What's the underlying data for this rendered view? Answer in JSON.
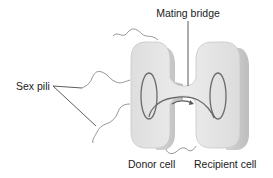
{
  "diagram": {
    "labels": {
      "mating_bridge": "Mating bridge",
      "sex_pili": "Sex pili",
      "donor_cell": "Donor cell",
      "recipient_cell": "Recipient cell"
    },
    "colors": {
      "cell_fill": "#e6e6e6",
      "cell_shadow": "#cfcfcf",
      "cell_edge": "#bdbdbd",
      "dna": "#6a6a6a",
      "pili": "#8a8a8a",
      "leader": "#333333",
      "text": "#1a1a1a"
    }
  }
}
